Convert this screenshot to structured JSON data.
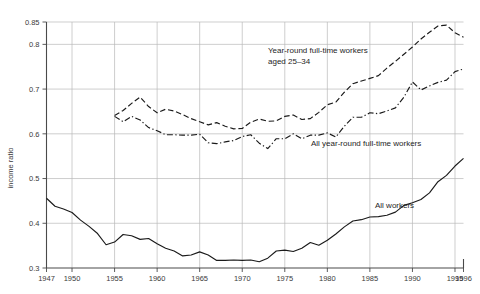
{
  "chart_data": {
    "type": "line",
    "title": "",
    "xlabel": "",
    "ylabel": "income ratio",
    "xlim": [
      1947,
      1996
    ],
    "ylim": [
      0.3,
      0.85
    ],
    "grid": true,
    "legend_position": "inline-annotations",
    "y_ticks": [
      0.3,
      0.4,
      0.5,
      0.6,
      0.7,
      0.8,
      0.85
    ],
    "y_tick_labels": [
      "0.3",
      "0.4",
      "0.5",
      "0.6",
      "0.7",
      "0.8",
      "0.85"
    ],
    "x_ticks": [
      1947,
      1950,
      1955,
      1960,
      1965,
      1970,
      1975,
      1980,
      1985,
      1990,
      1995,
      1996
    ],
    "x_tick_labels": [
      "1947",
      "1950",
      "1955",
      "1960",
      "1965",
      "1970",
      "1975",
      "1980",
      "1985",
      "1990",
      "1995",
      "1996"
    ],
    "series": [
      {
        "name": "Year-round full-time workers aged 25–34",
        "style": "dashed",
        "label_text_line1": "Year-round full-time workers",
        "label_text_line2": "aged 25–34",
        "x": [
          1955,
          1956,
          1957,
          1958,
          1959,
          1960,
          1961,
          1962,
          1963,
          1964,
          1965,
          1966,
          1967,
          1968,
          1969,
          1970,
          1971,
          1972,
          1973,
          1974,
          1975,
          1976,
          1977,
          1978,
          1979,
          1980,
          1981,
          1982,
          1983,
          1984,
          1985,
          1986,
          1987,
          1988,
          1989,
          1990,
          1991,
          1992,
          1993,
          1994,
          1995,
          1996
        ],
        "y": [
          0.641,
          0.652,
          0.668,
          0.682,
          0.661,
          0.647,
          0.655,
          0.651,
          0.643,
          0.634,
          0.627,
          0.62,
          0.625,
          0.617,
          0.611,
          0.612,
          0.626,
          0.633,
          0.628,
          0.629,
          0.639,
          0.642,
          0.632,
          0.634,
          0.648,
          0.665,
          0.671,
          0.693,
          0.712,
          0.718,
          0.724,
          0.73,
          0.747,
          0.762,
          0.778,
          0.794,
          0.812,
          0.827,
          0.841,
          0.843,
          0.826,
          0.816
        ]
      },
      {
        "name": "All year-round full-time workers",
        "style": "dash-dot",
        "label_text": "All year-round full-time workers",
        "x": [
          1955,
          1956,
          1957,
          1958,
          1959,
          1960,
          1961,
          1962,
          1963,
          1964,
          1965,
          1966,
          1967,
          1968,
          1969,
          1970,
          1971,
          1972,
          1973,
          1974,
          1975,
          1976,
          1977,
          1978,
          1979,
          1980,
          1981,
          1982,
          1983,
          1984,
          1985,
          1986,
          1987,
          1988,
          1989,
          1990,
          1991,
          1992,
          1993,
          1994,
          1995,
          1996
        ],
        "y": [
          0.639,
          0.627,
          0.639,
          0.631,
          0.614,
          0.607,
          0.598,
          0.598,
          0.597,
          0.597,
          0.599,
          0.58,
          0.578,
          0.582,
          0.585,
          0.594,
          0.598,
          0.579,
          0.567,
          0.589,
          0.589,
          0.6,
          0.589,
          0.597,
          0.597,
          0.602,
          0.593,
          0.617,
          0.637,
          0.637,
          0.647,
          0.645,
          0.651,
          0.658,
          0.682,
          0.716,
          0.698,
          0.707,
          0.715,
          0.72,
          0.739,
          0.745
        ]
      },
      {
        "name": "All workers",
        "style": "solid",
        "label_text": "All workers",
        "x": [
          1947,
          1948,
          1949,
          1950,
          1951,
          1952,
          1953,
          1954,
          1955,
          1956,
          1957,
          1958,
          1959,
          1960,
          1961,
          1962,
          1963,
          1964,
          1965,
          1966,
          1967,
          1968,
          1969,
          1970,
          1971,
          1972,
          1973,
          1974,
          1975,
          1976,
          1977,
          1978,
          1979,
          1980,
          1981,
          1982,
          1983,
          1984,
          1985,
          1986,
          1987,
          1988,
          1989,
          1990,
          1991,
          1992,
          1993,
          1994,
          1995,
          1996
        ],
        "y": [
          0.456,
          0.438,
          0.432,
          0.424,
          0.407,
          0.393,
          0.377,
          0.352,
          0.358,
          0.375,
          0.372,
          0.364,
          0.366,
          0.354,
          0.344,
          0.338,
          0.327,
          0.329,
          0.336,
          0.329,
          0.317,
          0.317,
          0.318,
          0.317,
          0.318,
          0.314,
          0.322,
          0.338,
          0.34,
          0.337,
          0.344,
          0.357,
          0.351,
          0.362,
          0.376,
          0.392,
          0.405,
          0.408,
          0.414,
          0.415,
          0.418,
          0.425,
          0.44,
          0.446,
          0.453,
          0.468,
          0.493,
          0.507,
          0.528,
          0.545
        ]
      }
    ]
  },
  "annotations": {
    "y_axis_title": "income ratio"
  }
}
